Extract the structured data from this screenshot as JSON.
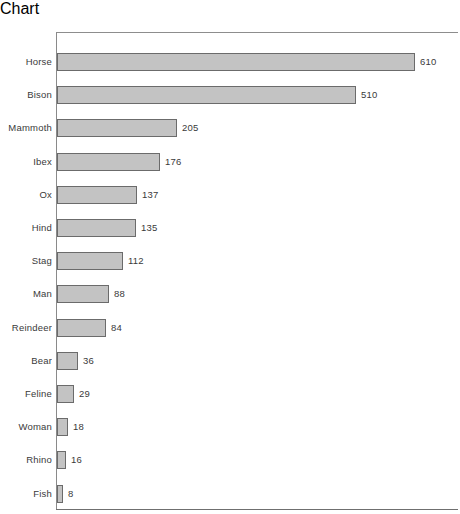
{
  "chart_data": {
    "type": "bar",
    "orientation": "horizontal",
    "title": "",
    "subtitle": "",
    "xlabel": "",
    "ylabel": "",
    "grid": false,
    "legend": null,
    "xlim": [
      0,
      610
    ],
    "categories": [
      "Horse",
      "Bison",
      "Mammoth",
      "Ibex",
      "Ox",
      "Hind",
      "Stag",
      "Man",
      "Reindeer",
      "Bear",
      "Feline",
      "Woman",
      "Rhino",
      "Fish"
    ],
    "values": [
      610,
      510,
      205,
      176,
      137,
      135,
      112,
      88,
      84,
      36,
      29,
      18,
      16,
      8
    ],
    "value_labels": [
      "610",
      "510",
      "205",
      "176",
      "137",
      "135",
      "112",
      "88",
      "84",
      "36",
      "29",
      "18",
      "16",
      "8"
    ],
    "bar_color": "#c3c3c3",
    "bar_border_color": "#6b6b6b",
    "axis_color": "#8a8a8a",
    "background": "#ffffff"
  },
  "layout": {
    "plot_left": 57,
    "pixels_per_unit": 0.587,
    "row_pitch": 33.2,
    "first_row_top": 21,
    "bar_height": 18,
    "value_gap": 5
  }
}
